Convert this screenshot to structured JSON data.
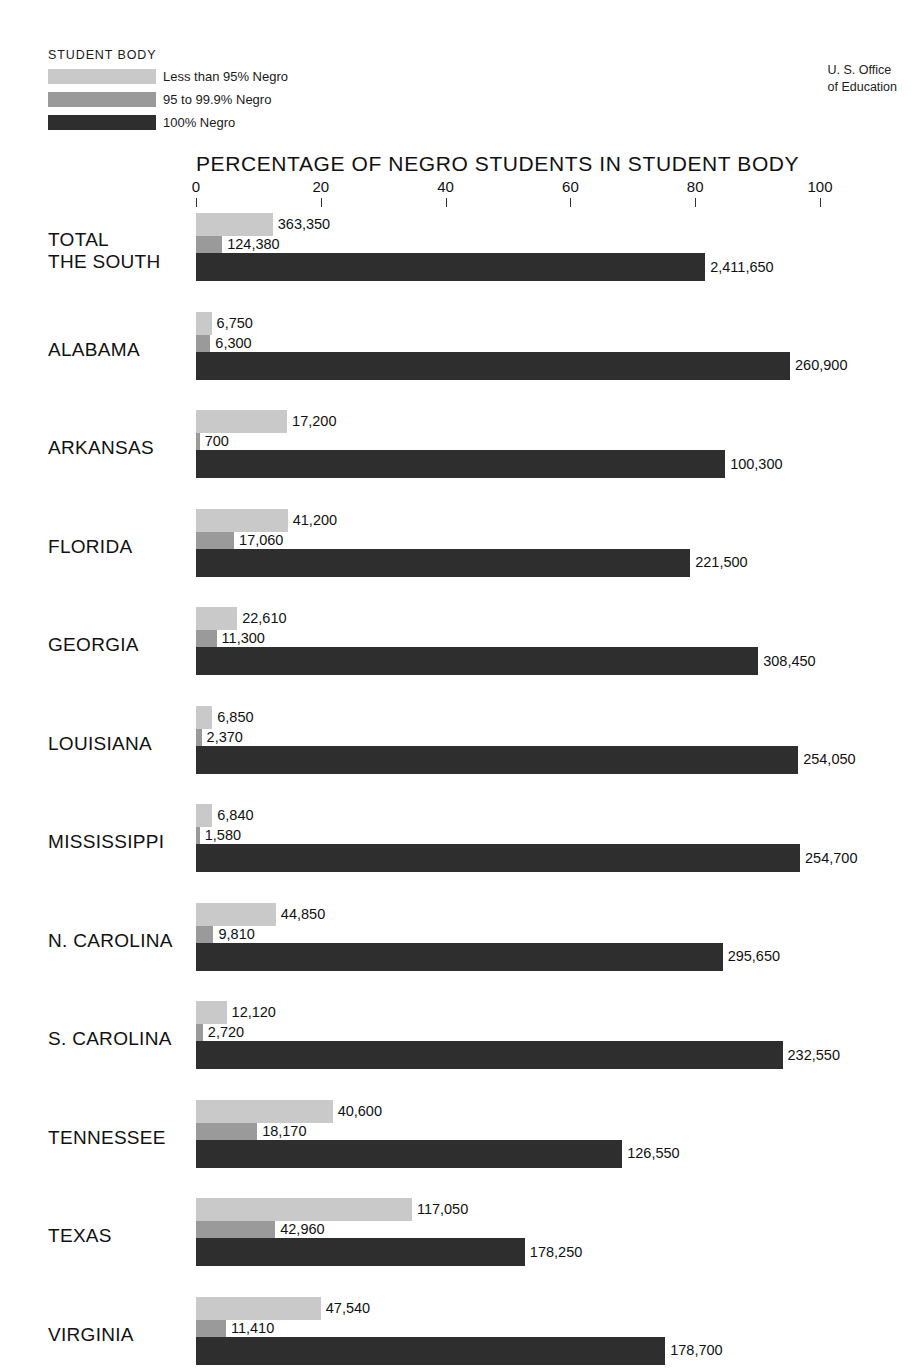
{
  "legend": {
    "title": "STUDENT BODY",
    "items": [
      {
        "label": "Less than 95% Negro",
        "color": "#c9c9c9"
      },
      {
        "label": "95 to 99.9% Negro",
        "color": "#9a9a9a"
      },
      {
        "label": "100% Negro",
        "color": "#2e2e2e"
      }
    ]
  },
  "source": {
    "line1": "U. S. Office",
    "line2": "of Education"
  },
  "chart_data": {
    "type": "bar",
    "orientation": "horizontal",
    "title": "PERCENTAGE OF NEGRO STUDENTS IN STUDENT BODY",
    "xlabel": "",
    "ylabel": "",
    "xlim": [
      0,
      100
    ],
    "xticks": [
      0,
      20,
      40,
      60,
      80,
      100
    ],
    "xtick_labels": [
      "0",
      "20",
      "40",
      "60",
      "80",
      "100"
    ],
    "grid": false,
    "legend_position": "top-left",
    "series": [
      {
        "name": "Less than 95% Negro",
        "color": "#c9c9c9"
      },
      {
        "name": "95 to 99.9% Negro",
        "color": "#9a9a9a"
      },
      {
        "name": "100% Negro",
        "color": "#2e2e2e"
      }
    ],
    "categories": [
      "TOTAL\nTHE SOUTH",
      "ALABAMA",
      "ARKANSAS",
      "FLORIDA",
      "GEORGIA",
      "LOUISIANA",
      "MISSISSIPPI",
      "N. CAROLINA",
      "S. CAROLINA",
      "TENNESSEE",
      "TEXAS",
      "VIRGINIA"
    ],
    "rows": [
      {
        "category": "TOTAL\nTHE SOUTH",
        "bars": [
          {
            "series": "Less than 95% Negro",
            "label": "363,350",
            "percent": 12.3
          },
          {
            "series": "95 to 99.9% Negro",
            "label": "124,380",
            "percent": 4.2
          },
          {
            "series": "100% Negro",
            "label": "2,411,650",
            "percent": 81.6
          }
        ]
      },
      {
        "category": "ALABAMA",
        "bars": [
          {
            "series": "Less than 95% Negro",
            "label": "6,750",
            "percent": 2.5
          },
          {
            "series": "95 to 99.9% Negro",
            "label": "6,300",
            "percent": 2.3
          },
          {
            "series": "100% Negro",
            "label": "260,900",
            "percent": 95.2
          }
        ]
      },
      {
        "category": "ARKANSAS",
        "bars": [
          {
            "series": "Less than 95% Negro",
            "label": "17,200",
            "percent": 14.6
          },
          {
            "series": "95 to 99.9% Negro",
            "label": "700",
            "percent": 0.6
          },
          {
            "series": "100% Negro",
            "label": "100,300",
            "percent": 84.8
          }
        ]
      },
      {
        "category": "FLORIDA",
        "bars": [
          {
            "series": "Less than 95% Negro",
            "label": "41,200",
            "percent": 14.7
          },
          {
            "series": "95 to 99.9% Negro",
            "label": "17,060",
            "percent": 6.1
          },
          {
            "series": "100% Negro",
            "label": "221,500",
            "percent": 79.2
          }
        ]
      },
      {
        "category": "GEORGIA",
        "bars": [
          {
            "series": "Less than 95% Negro",
            "label": "22,610",
            "percent": 6.6
          },
          {
            "series": "95 to 99.9% Negro",
            "label": "11,300",
            "percent": 3.3
          },
          {
            "series": "100% Negro",
            "label": "308,450",
            "percent": 90.1
          }
        ]
      },
      {
        "category": "LOUISIANA",
        "bars": [
          {
            "series": "Less than 95% Negro",
            "label": "6,850",
            "percent": 2.6
          },
          {
            "series": "95 to 99.9% Negro",
            "label": "2,370",
            "percent": 0.9
          },
          {
            "series": "100% Negro",
            "label": "254,050",
            "percent": 96.5
          }
        ]
      },
      {
        "category": "MISSISSIPPI",
        "bars": [
          {
            "series": "Less than 95% Negro",
            "label": "6,840",
            "percent": 2.6
          },
          {
            "series": "95 to 99.9% Negro",
            "label": "1,580",
            "percent": 0.6
          },
          {
            "series": "100% Negro",
            "label": "254,700",
            "percent": 96.8
          }
        ]
      },
      {
        "category": "N. CAROLINA",
        "bars": [
          {
            "series": "Less than 95% Negro",
            "label": "44,850",
            "percent": 12.8
          },
          {
            "series": "95 to 99.9% Negro",
            "label": "9,810",
            "percent": 2.8
          },
          {
            "series": "100% Negro",
            "label": "295,650",
            "percent": 84.4
          }
        ]
      },
      {
        "category": "S. CAROLINA",
        "bars": [
          {
            "series": "Less than 95% Negro",
            "label": "12,120",
            "percent": 4.9
          },
          {
            "series": "95 to 99.9% Negro",
            "label": "2,720",
            "percent": 1.1
          },
          {
            "series": "100% Negro",
            "label": "232,550",
            "percent": 94.0
          }
        ]
      },
      {
        "category": "TENNESSEE",
        "bars": [
          {
            "series": "Less than 95% Negro",
            "label": "40,600",
            "percent": 21.9
          },
          {
            "series": "95 to 99.9% Negro",
            "label": "18,170",
            "percent": 9.8
          },
          {
            "series": "100% Negro",
            "label": "126,550",
            "percent": 68.3
          }
        ]
      },
      {
        "category": "TEXAS",
        "bars": [
          {
            "series": "Less than 95% Negro",
            "label": "117,050",
            "percent": 34.6
          },
          {
            "series": "95 to 99.9% Negro",
            "label": "42,960",
            "percent": 12.7
          },
          {
            "series": "100% Negro",
            "label": "178,250",
            "percent": 52.7
          }
        ]
      },
      {
        "category": "VIRGINIA",
        "bars": [
          {
            "series": "Less than 95% Negro",
            "label": "47,540",
            "percent": 20.0
          },
          {
            "series": "95 to 99.9% Negro",
            "label": "11,410",
            "percent": 4.8
          },
          {
            "series": "100% Negro",
            "label": "178,700",
            "percent": 75.2
          }
        ]
      }
    ]
  }
}
